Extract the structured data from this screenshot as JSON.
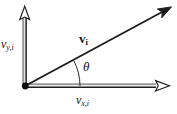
{
  "figure": {
    "name": "vector-components-diagram",
    "background_color": "#ffffff",
    "width": 177,
    "height": 114,
    "stroke_color": "#111111",
    "axis_light_color": "#8c8c8c"
  },
  "labels": {
    "y_axis": {
      "base": "v",
      "subscript": "y,i",
      "full": "v_{y,i}"
    },
    "x_axis": {
      "base": "v",
      "subscript": "x,i",
      "full": "v_{x,i}"
    },
    "vector": {
      "base": "v",
      "subscript": "i",
      "full": "v_i"
    },
    "angle": {
      "symbol": "θ",
      "full": "theta"
    }
  },
  "geometry": {
    "origin": {
      "x": 25,
      "y": 86
    },
    "y_axis_tip": {
      "x": 25,
      "y": 8
    },
    "x_axis_tip": {
      "x": 168,
      "y": 86
    },
    "vector_tip": {
      "x": 170,
      "y": 8
    },
    "angle_degrees": 28,
    "arc_radius": 55,
    "origin_dot_radius": 3.4
  },
  "icons": {
    "y_axis_arrow": "open-arrowhead-icon",
    "x_axis_arrow": "open-arrowhead-icon",
    "vector_arrow": "filled-arrowhead-icon",
    "origin_marker": "origin-dot-icon",
    "angle_arc": "angle-arc-icon"
  }
}
